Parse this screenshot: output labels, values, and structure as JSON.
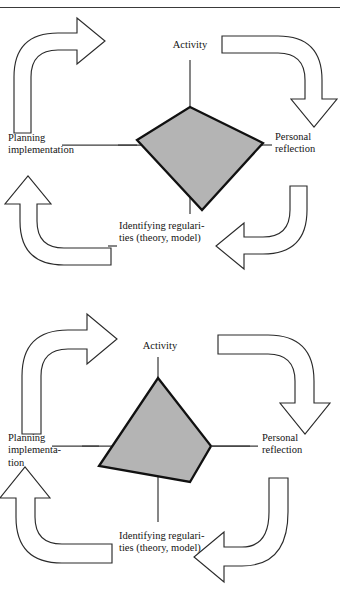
{
  "page": {
    "header_faint_text": "",
    "background_color": "#ffffff",
    "ink_color": "#141414"
  },
  "colors": {
    "polygon_fill": "#b4b4b4",
    "polygon_stroke": "#111111",
    "arrow_fill": "#ffffff",
    "arrow_stroke": "#2b2b2b",
    "axis_stroke": "#3d3d3d",
    "rule_stroke": "#3a3a3a"
  },
  "figures": [
    {
      "id": "figure-one",
      "name": "cyclic-model-asymmetric",
      "labels": {
        "top": "Activity",
        "right": "Personal\nreflection",
        "bottom": "Identifying regulari-\nties (theory, model)",
        "left": "Planning\nimplementation"
      },
      "arrows": [
        {
          "name": "arrow-planning-to-activity",
          "direction": "up-right"
        },
        {
          "name": "arrow-activity-to-reflection",
          "direction": "right-down"
        },
        {
          "name": "arrow-reflection-to-regularities",
          "direction": "down-left"
        },
        {
          "name": "arrow-regularities-to-planning",
          "direction": "left-up"
        }
      ],
      "polygon": {
        "name": "profile-polygon",
        "shape": "quadrilateral",
        "vertices_label": [
          "Activity",
          "Personal reflection",
          "Identifying regularities",
          "Planning implementation"
        ]
      }
    },
    {
      "id": "figure-two",
      "name": "cyclic-model-balanced",
      "labels": {
        "top": "Activity",
        "right": "Personal\nreflection",
        "bottom": "Identifying regulari-\nties (theory, model)",
        "left": "Planning\nimplementa-\ntion"
      },
      "arrows": [
        {
          "name": "arrow-planning-to-activity",
          "direction": "up-right"
        },
        {
          "name": "arrow-activity-to-reflection",
          "direction": "right-down"
        },
        {
          "name": "arrow-reflection-to-regularities",
          "direction": "down-left"
        },
        {
          "name": "arrow-regularities-to-planning",
          "direction": "left-up"
        }
      ],
      "polygon": {
        "name": "profile-polygon",
        "shape": "quadrilateral",
        "vertices_label": [
          "Activity",
          "Personal reflection",
          "Identifying regularities",
          "Planning implementation"
        ]
      }
    }
  ]
}
